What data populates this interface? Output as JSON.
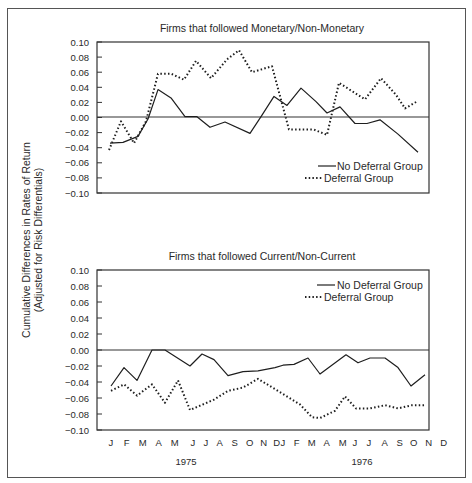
{
  "figure": {
    "ylabel_line1": "Cumulative Differences in Rates of Return",
    "ylabel_line2": "(Adjusted for Risk Differentials)",
    "months": [
      "J",
      "F",
      "M",
      "A",
      "M",
      "J",
      "J",
      "A",
      "S",
      "O",
      "N",
      "D"
    ],
    "years": [
      "1975",
      "1976"
    ]
  },
  "chart_data": [
    {
      "type": "line",
      "title": "Firms that followed Monetary/Non-Monetary",
      "xlabel": "",
      "ylabel": "Cumulative Differences in Rates of Return (Adjusted for Risk Differentials)",
      "ylim": [
        -0.1,
        0.1
      ],
      "yticks": [
        "0.10",
        "0.08",
        "0.06",
        "0.04",
        "0.02",
        "0.00",
        "-0.02",
        "-0.04",
        "-0.06",
        "-0.08",
        "-0.10"
      ],
      "legend_position": "lower right",
      "series": [
        {
          "name": "No Deferral Group",
          "style": "solid",
          "points": [
            [
              110,
              -0.034
            ],
            [
              123,
              -0.033
            ],
            [
              138,
              -0.025
            ],
            [
              148,
              -0.002
            ],
            [
              158,
              0.037
            ],
            [
              171,
              0.026
            ],
            [
              185,
              0.001
            ],
            [
              197,
              0.001
            ],
            [
              210,
              -0.013
            ],
            [
              225,
              -0.006
            ],
            [
              250,
              -0.021
            ],
            [
              262,
              0.003
            ],
            [
              274,
              0.028
            ],
            [
              287,
              0.016
            ],
            [
              301,
              0.039
            ],
            [
              316,
              0.021
            ],
            [
              327,
              0.006
            ],
            [
              340,
              0.014
            ],
            [
              355,
              -0.008
            ],
            [
              367,
              -0.008
            ],
            [
              380,
              -0.003
            ],
            [
              398,
              -0.022
            ],
            [
              418,
              -0.046
            ]
          ]
        },
        {
          "name": "Deferral Group",
          "style": "dotted",
          "points": [
            [
              109,
              -0.043
            ],
            [
              121,
              -0.005
            ],
            [
              134,
              -0.034
            ],
            [
              146,
              -0.005
            ],
            [
              158,
              0.058
            ],
            [
              171,
              0.058
            ],
            [
              184,
              0.05
            ],
            [
              196,
              0.075
            ],
            [
              211,
              0.052
            ],
            [
              227,
              0.077
            ],
            [
              239,
              0.089
            ],
            [
              252,
              0.06
            ],
            [
              272,
              0.068
            ],
            [
              289,
              -0.016
            ],
            [
              314,
              -0.016
            ],
            [
              327,
              -0.023
            ],
            [
              339,
              0.046
            ],
            [
              365,
              0.024
            ],
            [
              381,
              0.052
            ],
            [
              396,
              0.03
            ],
            [
              405,
              0.012
            ],
            [
              418,
              0.022
            ]
          ]
        }
      ]
    },
    {
      "type": "line",
      "title": "Firms that followed Current/Non-Current",
      "xlabel": "",
      "ylabel": "Cumulative Differences in Rates of Return (Adjusted for Risk Differentials)",
      "ylim": [
        -0.1,
        0.1
      ],
      "yticks": [
        "0.10",
        "0.08",
        "0.06",
        "0.04",
        "0.02",
        "0.00",
        "-0.02",
        "-0.04",
        "-0.06",
        "-0.08",
        "-0.10"
      ],
      "legend_position": "upper right",
      "series": [
        {
          "name": "No Deferral Group",
          "style": "solid",
          "points": [
            [
              111,
              -0.045
            ],
            [
              124,
              -0.022
            ],
            [
              137,
              -0.038
            ],
            [
              152,
              0.0
            ],
            [
              165,
              0.0
            ],
            [
              190,
              -0.02
            ],
            [
              202,
              -0.005
            ],
            [
              214,
              -0.012
            ],
            [
              228,
              -0.032
            ],
            [
              243,
              -0.027
            ],
            [
              258,
              -0.026
            ],
            [
              275,
              -0.022
            ],
            [
              283,
              -0.019
            ],
            [
              294,
              -0.018
            ],
            [
              308,
              -0.01
            ],
            [
              320,
              -0.03
            ],
            [
              346,
              -0.006
            ],
            [
              358,
              -0.016
            ],
            [
              370,
              -0.01
            ],
            [
              385,
              -0.01
            ],
            [
              398,
              -0.022
            ],
            [
              411,
              -0.045
            ],
            [
              425,
              -0.031
            ]
          ]
        },
        {
          "name": "Deferral Group",
          "style": "dotted",
          "points": [
            [
              111,
              -0.051
            ],
            [
              124,
              -0.043
            ],
            [
              137,
              -0.057
            ],
            [
              152,
              -0.043
            ],
            [
              165,
              -0.066
            ],
            [
              178,
              -0.038
            ],
            [
              190,
              -0.075
            ],
            [
              214,
              -0.062
            ],
            [
              228,
              -0.051
            ],
            [
              243,
              -0.047
            ],
            [
              258,
              -0.036
            ],
            [
              283,
              -0.055
            ],
            [
              300,
              -0.068
            ],
            [
              312,
              -0.084
            ],
            [
              320,
              -0.085
            ],
            [
              335,
              -0.076
            ],
            [
              345,
              -0.058
            ],
            [
              356,
              -0.073
            ],
            [
              370,
              -0.073
            ],
            [
              385,
              -0.069
            ],
            [
              398,
              -0.073
            ],
            [
              412,
              -0.069
            ],
            [
              425,
              -0.069
            ]
          ]
        }
      ]
    }
  ]
}
